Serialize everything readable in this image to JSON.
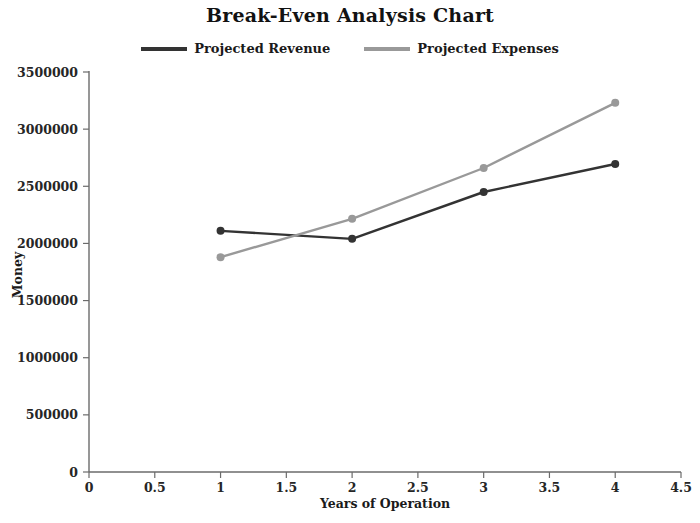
{
  "chart_data": {
    "type": "line",
    "title": "Break-Even Analysis Chart",
    "xlabel": "Years of Operation",
    "ylabel": "Money",
    "xlim": [
      0,
      4.5
    ],
    "ylim": [
      0,
      3500000
    ],
    "x": [
      1,
      2,
      3,
      4
    ],
    "xticks": [
      "0",
      "0.5",
      "1",
      "1.5",
      "2",
      "2.5",
      "3",
      "3.5",
      "4",
      "4.5"
    ],
    "xtick_values": [
      0,
      0.5,
      1,
      1.5,
      2,
      2.5,
      3,
      3.5,
      4,
      4.5
    ],
    "yticks": [
      "0",
      "500000",
      "1000000",
      "1500000",
      "2000000",
      "2500000",
      "3000000",
      "3500000"
    ],
    "ytick_values": [
      0,
      500000,
      1000000,
      1500000,
      2000000,
      2500000,
      3000000,
      3500000
    ],
    "grid": false,
    "legend_position": "top-center",
    "markers": "circle",
    "series": [
      {
        "name": "Projected Revenue",
        "color": "#333333",
        "values": [
          2110000,
          2040000,
          2450000,
          2695000
        ]
      },
      {
        "name": "Projected Expenses",
        "color": "#999999",
        "values": [
          1880000,
          2215000,
          2660000,
          3230000
        ]
      }
    ]
  },
  "legend": {
    "items": [
      {
        "label": "Projected Revenue"
      },
      {
        "label": "Projected Expenses"
      }
    ]
  }
}
